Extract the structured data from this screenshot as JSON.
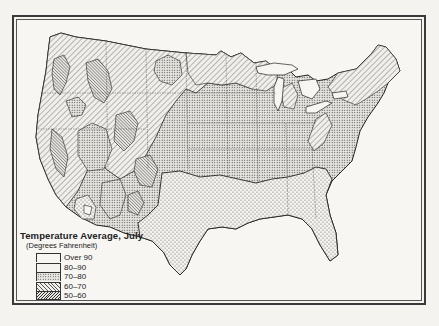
{
  "map": {
    "title": "Temperature Average, July",
    "subtitle": "(Degrees Fahrenheit)",
    "region": "United States",
    "legend": [
      {
        "label": "Over 90",
        "pattern": "blank",
        "color": "#f7f6f3"
      },
      {
        "label": "80–90",
        "pattern": "sparse-dots",
        "color": "#e9e7e2"
      },
      {
        "label": "70–80",
        "pattern": "dense-dots",
        "color": "#c9c7c2"
      },
      {
        "label": "60–70",
        "pattern": "light-hatch",
        "color": "#d6d4cf"
      },
      {
        "label": "50–60",
        "pattern": "dense-hatch",
        "color": "#a9a7a2"
      }
    ]
  }
}
